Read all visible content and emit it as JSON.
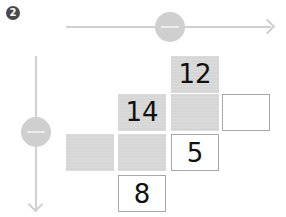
{
  "badge": {
    "label": "2"
  },
  "axes": {
    "horizontal": {
      "direction": "right",
      "color": "#d0d0d0"
    },
    "vertical": {
      "direction": "down",
      "color": "#d0d0d0"
    },
    "knob_color": "#cfcfcf",
    "knob_symbol": "minus"
  },
  "grid": {
    "shaded_color": "#d6d6d6",
    "border_color": "#a8a8a8",
    "cells": [
      {
        "row": 1,
        "col": 3,
        "style": "shaded",
        "value": "12"
      },
      {
        "row": 2,
        "col": 2,
        "style": "shaded",
        "value": "14"
      },
      {
        "row": 2,
        "col": 3,
        "style": "shaded",
        "value": ""
      },
      {
        "row": 2,
        "col": 4,
        "style": "blank",
        "value": ""
      },
      {
        "row": 3,
        "col": 1,
        "style": "shaded",
        "value": ""
      },
      {
        "row": 3,
        "col": 2,
        "style": "shaded",
        "value": ""
      },
      {
        "row": 3,
        "col": 3,
        "style": "blank",
        "value": "5"
      },
      {
        "row": 4,
        "col": 2,
        "style": "blank",
        "value": "8"
      }
    ]
  }
}
